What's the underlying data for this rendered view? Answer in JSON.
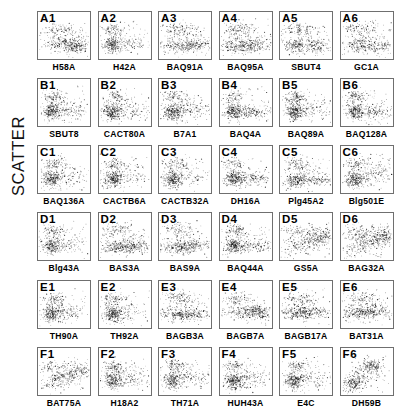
{
  "figure": {
    "axis_label": "SCATTER",
    "grid_rows": 6,
    "grid_cols": 6
  },
  "chart_data": {
    "type": "scatter",
    "title": "",
    "xlabel": "",
    "ylabel": "SCATTER",
    "grid": false,
    "legend_position": "none",
    "layout": {
      "rows": 6,
      "cols": 6,
      "panel_count": 36
    },
    "note": "6x6 grid of small two-parameter scatter (dot) plots; each panel shows a dense cluster of points with SCATTER on the vertical axis. Axis tick labels are not printed on the panels.",
    "panels": [
      {
        "id": "A1",
        "label": "H58A",
        "row": "A",
        "col": 1,
        "cluster": "dense-lower-right-band",
        "n_points": 520
      },
      {
        "id": "A2",
        "label": "H42A",
        "row": "A",
        "col": 2,
        "cluster": "dense-left-blob",
        "n_points": 470
      },
      {
        "id": "A3",
        "label": "BAQ91A",
        "row": "A",
        "col": 3,
        "cluster": "broad-lower-band",
        "n_points": 540
      },
      {
        "id": "A4",
        "label": "BAQ95A",
        "row": "A",
        "col": 4,
        "cluster": "broad-lower-band",
        "n_points": 560
      },
      {
        "id": "A5",
        "label": "SBUT4",
        "row": "A",
        "col": 5,
        "cluster": "two-lobe-lower-band",
        "n_points": 500
      },
      {
        "id": "A6",
        "label": "GC1A",
        "row": "A",
        "col": 6,
        "cluster": "diffuse-lower-band",
        "n_points": 480
      },
      {
        "id": "B1",
        "label": "SBUT8",
        "row": "B",
        "col": 1,
        "cluster": "dense-left-blob",
        "n_points": 510
      },
      {
        "id": "B2",
        "label": "CACT80A",
        "row": "B",
        "col": 2,
        "cluster": "dense-left-blob",
        "n_points": 500
      },
      {
        "id": "B3",
        "label": "B7A1",
        "row": "B",
        "col": 3,
        "cluster": "dense-left-blob",
        "n_points": 520
      },
      {
        "id": "B4",
        "label": "BAQ4A",
        "row": "B",
        "col": 4,
        "cluster": "dense-left-blob-with-tail",
        "n_points": 530
      },
      {
        "id": "B5",
        "label": "BAQ89A",
        "row": "B",
        "col": 5,
        "cluster": "dense-left-blob",
        "n_points": 560
      },
      {
        "id": "B6",
        "label": "BAQ128A",
        "row": "B",
        "col": 6,
        "cluster": "dense-left-blob-with-tail",
        "n_points": 540
      },
      {
        "id": "C1",
        "label": "BAQ136A",
        "row": "C",
        "col": 1,
        "cluster": "dense-left-blob",
        "n_points": 490
      },
      {
        "id": "C2",
        "label": "CACTB6A",
        "row": "C",
        "col": 2,
        "cluster": "dense-left-blob",
        "n_points": 500
      },
      {
        "id": "C3",
        "label": "CACTB32A",
        "row": "C",
        "col": 3,
        "cluster": "dense-left-blob",
        "n_points": 470
      },
      {
        "id": "C4",
        "label": "DH16A",
        "row": "C",
        "col": 4,
        "cluster": "dense-left-blob-with-tail",
        "n_points": 520
      },
      {
        "id": "C5",
        "label": "Plg45A2",
        "row": "C",
        "col": 5,
        "cluster": "lower-band-right-tail",
        "n_points": 530
      },
      {
        "id": "C6",
        "label": "Blg501E",
        "row": "C",
        "col": 6,
        "cluster": "dense-left-blob-with-diagonal",
        "n_points": 540
      },
      {
        "id": "D1",
        "label": "Blg43A",
        "row": "D",
        "col": 1,
        "cluster": "dense-left-blob",
        "n_points": 470
      },
      {
        "id": "D2",
        "label": "BAS3A",
        "row": "D",
        "col": 2,
        "cluster": "broad-lower-band",
        "n_points": 560
      },
      {
        "id": "D3",
        "label": "BAS9A",
        "row": "D",
        "col": 3,
        "cluster": "broad-lower-band",
        "n_points": 540
      },
      {
        "id": "D4",
        "label": "BAQ44A",
        "row": "D",
        "col": 4,
        "cluster": "dense-left-blob-with-tail",
        "n_points": 530
      },
      {
        "id": "D5",
        "label": "GS5A",
        "row": "D",
        "col": 5,
        "cluster": "rising-diagonal-band",
        "n_points": 520
      },
      {
        "id": "D6",
        "label": "BAG32A",
        "row": "D",
        "col": 6,
        "cluster": "rising-diagonal-band",
        "n_points": 540
      },
      {
        "id": "E1",
        "label": "TH90A",
        "row": "E",
        "col": 1,
        "cluster": "dense-left-blob",
        "n_points": 500
      },
      {
        "id": "E2",
        "label": "TH92A",
        "row": "E",
        "col": 2,
        "cluster": "dense-left-blob",
        "n_points": 500
      },
      {
        "id": "E3",
        "label": "BAGB3A",
        "row": "E",
        "col": 3,
        "cluster": "broad-lower-band",
        "n_points": 520
      },
      {
        "id": "E4",
        "label": "BAGB7A",
        "row": "E",
        "col": 4,
        "cluster": "dense-right-band",
        "n_points": 510
      },
      {
        "id": "E5",
        "label": "BAGB17A",
        "row": "E",
        "col": 5,
        "cluster": "center-band",
        "n_points": 500
      },
      {
        "id": "E6",
        "label": "BAT31A",
        "row": "E",
        "col": 6,
        "cluster": "center-band",
        "n_points": 510
      },
      {
        "id": "F1",
        "label": "BAT75A",
        "row": "F",
        "col": 1,
        "cluster": "rising-diagonal-band",
        "n_points": 470
      },
      {
        "id": "F2",
        "label": "H18A2",
        "row": "F",
        "col": 2,
        "cluster": "dense-left-blob",
        "n_points": 490
      },
      {
        "id": "F3",
        "label": "TH71A",
        "row": "F",
        "col": 3,
        "cluster": "dense-left-blob",
        "n_points": 480
      },
      {
        "id": "F4",
        "label": "HUH43A",
        "row": "F",
        "col": 4,
        "cluster": "dense-left-blob",
        "n_points": 490
      },
      {
        "id": "F5",
        "label": "E4C",
        "row": "F",
        "col": 5,
        "cluster": "dense-left-blob",
        "n_points": 480
      },
      {
        "id": "F6",
        "label": "DH59B",
        "row": "F",
        "col": 6,
        "cluster": "two-cluster-diagonal",
        "n_points": 500
      }
    ]
  }
}
